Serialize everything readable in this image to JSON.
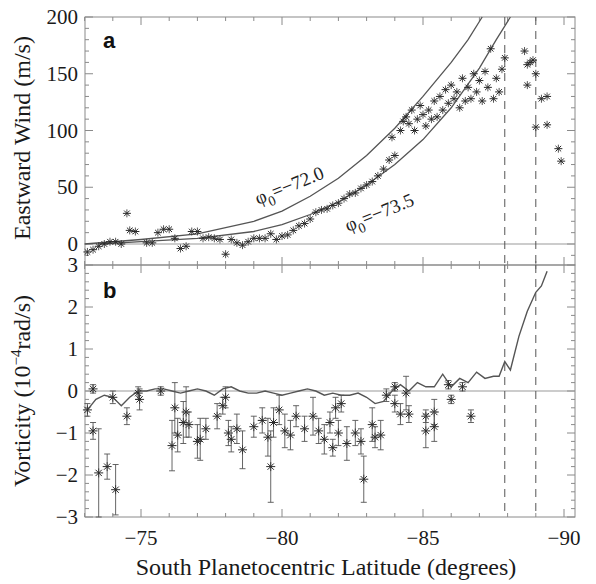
{
  "chart_data": [
    {
      "panel": "a",
      "type": "scatter",
      "panel_label": "a",
      "ylabel": "Eastward Wind (m/s)",
      "xlabel": "South Planetocentric Latitude (degrees)",
      "xlim": [
        -73,
        -90.4
      ],
      "ylim": [
        -10,
        200
      ],
      "yticks": [
        0,
        50,
        100,
        150,
        200
      ],
      "zero_line": true,
      "dashed_vlines": [
        -87.9,
        -89.0
      ],
      "model_curves": [
        {
          "name": "φ0=−72.0",
          "label_phi": "φ",
          "label_sub": "0",
          "label_rest": "=−72.0",
          "points": [
            [
              -73,
              0
            ],
            [
              -75,
              4
            ],
            [
              -77,
              9
            ],
            [
              -79,
              20
            ],
            [
              -80,
              29
            ],
            [
              -81,
              42
            ],
            [
              -82,
              58
            ],
            [
              -83,
              78
            ],
            [
              -84,
              102
            ],
            [
              -85,
              130
            ],
            [
              -86,
              160
            ],
            [
              -86.6,
              180
            ],
            [
              -87.1,
              200
            ]
          ]
        },
        {
          "name": "φ0=−73.5",
          "label_phi": "φ",
          "label_sub": "0",
          "label_rest": "=−73.5",
          "points": [
            [
              -73.5,
              0
            ],
            [
              -75,
              2
            ],
            [
              -77,
              5
            ],
            [
              -79,
              11
            ],
            [
              -80,
              17
            ],
            [
              -81,
              26
            ],
            [
              -82,
              37
            ],
            [
              -83,
              52
            ],
            [
              -84,
              70
            ],
            [
              -85,
              92
            ],
            [
              -86,
              120
            ],
            [
              -87,
              155
            ],
            [
              -87.6,
              180
            ],
            [
              -88.1,
              200
            ]
          ]
        }
      ],
      "points": [
        [
          -73.1,
          -7
        ],
        [
          -73.3,
          -5
        ],
        [
          -73.5,
          -2
        ],
        [
          -73.7,
          0
        ],
        [
          -73.9,
          2
        ],
        [
          -74.1,
          2
        ],
        [
          -74.3,
          0
        ],
        [
          -74.5,
          27
        ],
        [
          -74.6,
          12
        ],
        [
          -74.8,
          11
        ],
        [
          -75.2,
          1
        ],
        [
          -75.4,
          1
        ],
        [
          -75.6,
          10
        ],
        [
          -75.8,
          13
        ],
        [
          -76.0,
          13
        ],
        [
          -76.2,
          5
        ],
        [
          -76.4,
          -4
        ],
        [
          -76.6,
          -2
        ],
        [
          -76.8,
          11
        ],
        [
          -77.0,
          11
        ],
        [
          -77.2,
          5
        ],
        [
          -77.4,
          6
        ],
        [
          -77.6,
          5
        ],
        [
          -77.8,
          4
        ],
        [
          -78.0,
          -9
        ],
        [
          -78.2,
          4
        ],
        [
          -78.4,
          1
        ],
        [
          -78.6,
          -1
        ],
        [
          -78.8,
          2
        ],
        [
          -79.0,
          5
        ],
        [
          -79.2,
          5
        ],
        [
          -79.4,
          5
        ],
        [
          -79.6,
          9
        ],
        [
          -79.8,
          4
        ],
        [
          -80.0,
          7
        ],
        [
          -80.2,
          8
        ],
        [
          -80.4,
          12
        ],
        [
          -80.6,
          16
        ],
        [
          -80.8,
          18
        ],
        [
          -81.0,
          22
        ],
        [
          -81.2,
          28
        ],
        [
          -81.4,
          30
        ],
        [
          -81.6,
          31
        ],
        [
          -81.8,
          34
        ],
        [
          -82.0,
          36
        ],
        [
          -82.2,
          40
        ],
        [
          -82.4,
          44
        ],
        [
          -82.6,
          45
        ],
        [
          -82.8,
          49
        ],
        [
          -83.0,
          52
        ],
        [
          -83.2,
          55
        ],
        [
          -83.4,
          60
        ],
        [
          -83.6,
          66
        ],
        [
          -83.8,
          74
        ],
        [
          -83.9,
          94
        ],
        [
          -84.0,
          78
        ],
        [
          -84.2,
          100
        ],
        [
          -84.3,
          108
        ],
        [
          -84.4,
          112
        ],
        [
          -84.5,
          106
        ],
        [
          -84.6,
          118
        ],
        [
          -84.7,
          100
        ],
        [
          -84.8,
          110
        ],
        [
          -84.9,
          122
        ],
        [
          -85.0,
          114
        ],
        [
          -85.1,
          104
        ],
        [
          -85.2,
          118
        ],
        [
          -85.3,
          110
        ],
        [
          -85.4,
          126
        ],
        [
          -85.5,
          112
        ],
        [
          -85.6,
          130
        ],
        [
          -85.7,
          118
        ],
        [
          -85.8,
          136
        ],
        [
          -85.9,
          124
        ],
        [
          -86.0,
          140
        ],
        [
          -86.1,
          128
        ],
        [
          -86.2,
          134
        ],
        [
          -86.3,
          120
        ],
        [
          -86.4,
          146
        ],
        [
          -86.5,
          126
        ],
        [
          -86.6,
          138
        ],
        [
          -86.7,
          128
        ],
        [
          -86.8,
          150
        ],
        [
          -86.9,
          134
        ],
        [
          -87.0,
          144
        ],
        [
          -87.1,
          126
        ],
        [
          -87.2,
          152
        ],
        [
          -87.3,
          138
        ],
        [
          -87.4,
          172
        ],
        [
          -87.5,
          128
        ],
        [
          -87.6,
          146
        ],
        [
          -87.7,
          134
        ],
        [
          -87.8,
          154
        ],
        [
          -87.9,
          164
        ],
        [
          -88.6,
          170
        ],
        [
          -88.7,
          158
        ],
        [
          -88.8,
          160
        ],
        [
          -88.9,
          162
        ],
        [
          -89.0,
          150
        ],
        [
          -88.7,
          140
        ],
        [
          -89.2,
          128
        ],
        [
          -89.4,
          130
        ],
        [
          -89.0,
          103
        ],
        [
          -89.4,
          105
        ],
        [
          -89.8,
          84
        ],
        [
          -89.9,
          73
        ]
      ]
    },
    {
      "panel": "b",
      "type": "scatter",
      "panel_label": "b",
      "ylabel_main": "Vorticity (10",
      "ylabel_sup": "−4",
      "ylabel_rest": "rad/s)",
      "xlabel": "South Planetocentric Latitude (degrees)",
      "xlim": [
        -73,
        -90.4
      ],
      "ylim": [
        -3,
        3
      ],
      "yticks": [
        -3,
        -2,
        -1,
        0,
        1,
        2,
        3
      ],
      "zero_line": true,
      "dashed_vlines": [
        -87.9,
        -89.0
      ],
      "model_line": [
        [
          -73.1,
          -0.45
        ],
        [
          -73.4,
          -0.2
        ],
        [
          -73.7,
          -0.1
        ],
        [
          -74.0,
          -0.15
        ],
        [
          -74.3,
          -0.35
        ],
        [
          -74.6,
          -0.15
        ],
        [
          -74.9,
          0.0
        ],
        [
          -75.2,
          0.0
        ],
        [
          -75.5,
          0.05
        ],
        [
          -75.8,
          0.05
        ],
        [
          -76.1,
          0.0
        ],
        [
          -76.4,
          -0.05
        ],
        [
          -76.7,
          0.0
        ],
        [
          -77.0,
          0.05
        ],
        [
          -77.3,
          0.0
        ],
        [
          -77.6,
          -0.1
        ],
        [
          -77.9,
          0.05
        ],
        [
          -78.2,
          0.1
        ],
        [
          -78.5,
          0.0
        ],
        [
          -78.8,
          -0.05
        ],
        [
          -79.1,
          -0.05
        ],
        [
          -79.4,
          0.0
        ],
        [
          -79.7,
          -0.05
        ],
        [
          -80.0,
          -0.1
        ],
        [
          -80.3,
          -0.05
        ],
        [
          -80.6,
          0.0
        ],
        [
          -80.9,
          0.05
        ],
        [
          -81.2,
          0.0
        ],
        [
          -81.5,
          -0.1
        ],
        [
          -81.8,
          -0.05
        ],
        [
          -82.1,
          -0.1
        ],
        [
          -82.4,
          -0.1
        ],
        [
          -82.7,
          -0.05
        ],
        [
          -83.0,
          -0.15
        ],
        [
          -83.3,
          -0.3
        ],
        [
          -83.6,
          -0.25
        ],
        [
          -83.9,
          0.0
        ],
        [
          -84.2,
          0.15
        ],
        [
          -84.5,
          0.0
        ],
        [
          -84.8,
          0.2
        ],
        [
          -85.1,
          0.1
        ],
        [
          -85.4,
          0.1
        ],
        [
          -85.7,
          0.4
        ],
        [
          -86.0,
          0.1
        ],
        [
          -86.3,
          0.3
        ],
        [
          -86.6,
          0.2
        ],
        [
          -86.9,
          0.45
        ],
        [
          -87.2,
          0.3
        ],
        [
          -87.5,
          0.35
        ],
        [
          -87.7,
          0.35
        ],
        [
          -87.9,
          0.7
        ],
        [
          -88.1,
          0.5
        ],
        [
          -88.4,
          1.3
        ],
        [
          -88.7,
          1.9
        ],
        [
          -89.0,
          2.35
        ],
        [
          -89.2,
          2.5
        ],
        [
          -89.4,
          2.85
        ]
      ],
      "points": [
        {
          "x": -73.1,
          "y": -0.45,
          "e": 0.15
        },
        {
          "x": -73.3,
          "y": 0.05,
          "e": 0.1
        },
        {
          "x": -73.3,
          "y": -0.95,
          "e": 0.2
        },
        {
          "x": -73.5,
          "y": -1.95,
          "e": 1.05
        },
        {
          "x": -73.8,
          "y": -1.8,
          "e": 0.3
        },
        {
          "x": -74.0,
          "y": -0.15,
          "e": 0.15
        },
        {
          "x": -74.1,
          "y": -2.35,
          "e": 0.6
        },
        {
          "x": -74.5,
          "y": -0.6,
          "e": 0.2
        },
        {
          "x": -74.9,
          "y": -0.05,
          "e": 0.15
        },
        {
          "x": -74.95,
          "y": -0.2,
          "e": 0.25
        },
        {
          "x": -75.7,
          "y": 0.0,
          "e": 0.1
        },
        {
          "x": -76.1,
          "y": -1.3,
          "e": 0.6
        },
        {
          "x": -76.2,
          "y": -0.4,
          "e": 0.6
        },
        {
          "x": -76.3,
          "y": -1.05,
          "e": 0.4
        },
        {
          "x": -76.5,
          "y": -0.75,
          "e": 0.5
        },
        {
          "x": -76.6,
          "y": -0.5,
          "e": 0.6
        },
        {
          "x": -76.7,
          "y": -0.8,
          "e": 0.3
        },
        {
          "x": -77.0,
          "y": -1.2,
          "e": 0.4
        },
        {
          "x": -77.1,
          "y": -1.15,
          "e": 0.5
        },
        {
          "x": -77.3,
          "y": -0.9,
          "e": 0.25
        },
        {
          "x": -77.7,
          "y": -0.6,
          "e": 0.3
        },
        {
          "x": -77.9,
          "y": -0.35,
          "e": 0.2
        },
        {
          "x": -78.0,
          "y": -0.15,
          "e": 0.25
        },
        {
          "x": -78.1,
          "y": -1.0,
          "e": 0.3
        },
        {
          "x": -78.2,
          "y": -1.15,
          "e": 0.3
        },
        {
          "x": -78.4,
          "y": -0.9,
          "e": 0.35
        },
        {
          "x": -78.6,
          "y": -1.4,
          "e": 0.45
        },
        {
          "x": -79.0,
          "y": -0.85,
          "e": 0.25
        },
        {
          "x": -79.3,
          "y": -0.7,
          "e": 0.3
        },
        {
          "x": -79.5,
          "y": -1.1,
          "e": 0.45
        },
        {
          "x": -79.6,
          "y": -1.8,
          "e": 0.85
        },
        {
          "x": -79.7,
          "y": -0.75,
          "e": 0.35
        },
        {
          "x": -79.9,
          "y": -0.45,
          "e": 0.35
        },
        {
          "x": -80.1,
          "y": -0.95,
          "e": 0.4
        },
        {
          "x": -80.3,
          "y": -1.05,
          "e": 0.35
        },
        {
          "x": -80.5,
          "y": -0.6,
          "e": 0.25
        },
        {
          "x": -80.8,
          "y": -0.9,
          "e": 0.3
        },
        {
          "x": -81.1,
          "y": -0.6,
          "e": 0.45
        },
        {
          "x": -81.3,
          "y": -0.95,
          "e": 0.3
        },
        {
          "x": -81.5,
          "y": -1.15,
          "e": 0.35
        },
        {
          "x": -81.7,
          "y": -0.75,
          "e": 0.25
        },
        {
          "x": -81.8,
          "y": -1.35,
          "e": 0.2
        },
        {
          "x": -81.9,
          "y": -0.4,
          "e": 0.25
        },
        {
          "x": -82.0,
          "y": -1.0,
          "e": 0.3
        },
        {
          "x": -82.1,
          "y": -0.3,
          "e": 0.2
        },
        {
          "x": -82.3,
          "y": -1.25,
          "e": 0.4
        },
        {
          "x": -82.6,
          "y": -1.0,
          "e": 0.3
        },
        {
          "x": -82.8,
          "y": -1.2,
          "e": 0.3
        },
        {
          "x": -82.9,
          "y": -2.1,
          "e": 0.55
        },
        {
          "x": -83.2,
          "y": -0.8,
          "e": 0.4
        },
        {
          "x": -83.3,
          "y": -1.1,
          "e": 0.25
        },
        {
          "x": -83.5,
          "y": -1.05,
          "e": 0.35
        },
        {
          "x": -83.7,
          "y": -0.1,
          "e": 0.15
        },
        {
          "x": -84.0,
          "y": 0.1,
          "e": 0.1
        },
        {
          "x": -84.0,
          "y": -0.3,
          "e": 0.2
        },
        {
          "x": -84.2,
          "y": -0.55,
          "e": 0.25
        },
        {
          "x": -84.4,
          "y": -0.05,
          "e": 0.4
        },
        {
          "x": -84.5,
          "y": -0.55,
          "e": 0.2
        },
        {
          "x": -85.1,
          "y": -0.6,
          "e": 0.15
        },
        {
          "x": -85.1,
          "y": -0.95,
          "e": 0.4
        },
        {
          "x": -85.4,
          "y": -0.5,
          "e": 0.3
        },
        {
          "x": -85.4,
          "y": -0.85,
          "e": 0.35
        },
        {
          "x": -85.9,
          "y": 0.15,
          "e": 0.1
        },
        {
          "x": -86.0,
          "y": -0.2,
          "e": 0.1
        },
        {
          "x": -86.4,
          "y": 0.1,
          "e": 0.1
        },
        {
          "x": -86.7,
          "y": -0.6,
          "e": 0.15
        }
      ]
    }
  ],
  "axes": {
    "x_tick_labels": [
      "−75",
      "−80",
      "−85",
      "−90"
    ],
    "x_tick_values": [
      -75,
      -80,
      -85,
      -90
    ],
    "x_title": "South Planetocentric Latitude (degrees)",
    "top_y_tick_labels": [
      "0",
      "50",
      "100",
      "150",
      "200"
    ],
    "bottom_y_tick_labels": [
      "−3",
      "−2",
      "−1",
      "0",
      "1",
      "2",
      "3"
    ],
    "top_y_title": "Eastward Wind (m/s)",
    "bottom_y_title_main": "Vorticity (10",
    "bottom_y_title_sup": "−4",
    "bottom_y_title_rest": "rad/s)"
  },
  "labels": {
    "panel_a": "a",
    "panel_b": "b",
    "curve1_phi": "φ",
    "curve1_sub": "0",
    "curve1_rest": "=−72.0",
    "curve2_phi": "φ",
    "curve2_sub": "0",
    "curve2_rest": "=−73.5"
  },
  "colors": {
    "frame": "#8a8a8a",
    "data": "#2a2a2a",
    "curve": "#555555",
    "text": "#1a1a1a"
  }
}
